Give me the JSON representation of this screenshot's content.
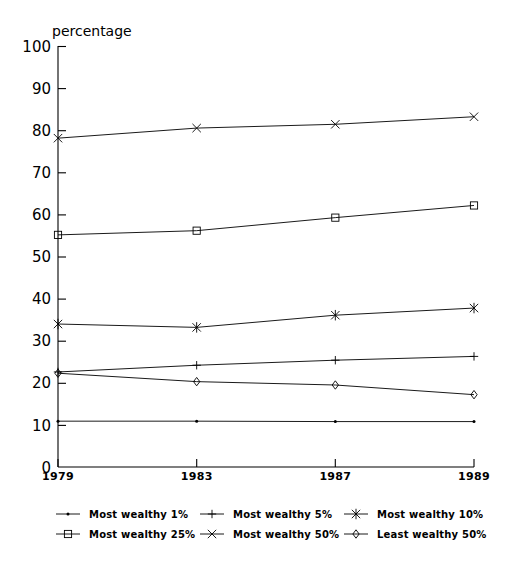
{
  "chart_data": {
    "type": "line",
    "title": "",
    "xlabel": "",
    "ylabel": "percentage",
    "axis_title_text": "percentage",
    "categories": [
      "1979",
      "1983",
      "1987",
      "1989"
    ],
    "x": [
      1979,
      1983,
      1987,
      1989
    ],
    "ylim": [
      0,
      100
    ],
    "yticks": [
      0,
      10,
      20,
      30,
      40,
      50,
      60,
      70,
      80,
      90,
      100
    ],
    "ytick_labels": [
      "0",
      "10",
      "20",
      "30",
      "40",
      "50",
      "60",
      "70",
      "80",
      "90",
      "100"
    ],
    "xtick_labels": [
      "1979",
      "1983",
      "1987",
      "1989"
    ],
    "grid": false,
    "legend_position": "bottom",
    "legend_columns": 3,
    "legend_rows": 2,
    "series": [
      {
        "name": "Most wealthy 1%",
        "marker": "dot",
        "marker_symbol": "·",
        "color": "#000000",
        "values": [
          10.9,
          10.9,
          10.8,
          10.8
        ]
      },
      {
        "name": "Most wealthy 5%",
        "marker": "plus",
        "marker_symbol": "+",
        "color": "#000000",
        "values": [
          22.6,
          24.2,
          25.4,
          26.3
        ]
      },
      {
        "name": "Most wealthy 10%",
        "marker": "star",
        "marker_symbol": "✳",
        "color": "#000000",
        "values": [
          34.0,
          33.2,
          36.1,
          37.8
        ]
      },
      {
        "name": "Most wealthy 25%",
        "marker": "square",
        "marker_symbol": "□",
        "color": "#000000",
        "values": [
          55.2,
          56.2,
          59.3,
          62.2
        ]
      },
      {
        "name": "Most wealthy 50%",
        "marker": "cross",
        "marker_symbol": "×",
        "color": "#000000",
        "values": [
          78.2,
          80.6,
          81.5,
          83.3
        ]
      },
      {
        "name": "Least wealthy 50%",
        "marker": "diamond",
        "marker_symbol": "◇",
        "color": "#000000",
        "values": [
          22.3,
          20.3,
          19.5,
          17.2
        ]
      }
    ]
  },
  "legend": {
    "entries": [
      {
        "label": "Most wealthy 1%",
        "marker": "dot"
      },
      {
        "label": "Most wealthy 5%",
        "marker": "plus"
      },
      {
        "label": "Most wealthy 10%",
        "marker": "star"
      },
      {
        "label": "Most wealthy 25%",
        "marker": "square"
      },
      {
        "label": "Most wealthy 50%",
        "marker": "cross"
      },
      {
        "label": "Least wealthy 50%",
        "marker": "diamond"
      }
    ]
  },
  "colors": {
    "background": "#ffffff",
    "ink": "#000000"
  }
}
